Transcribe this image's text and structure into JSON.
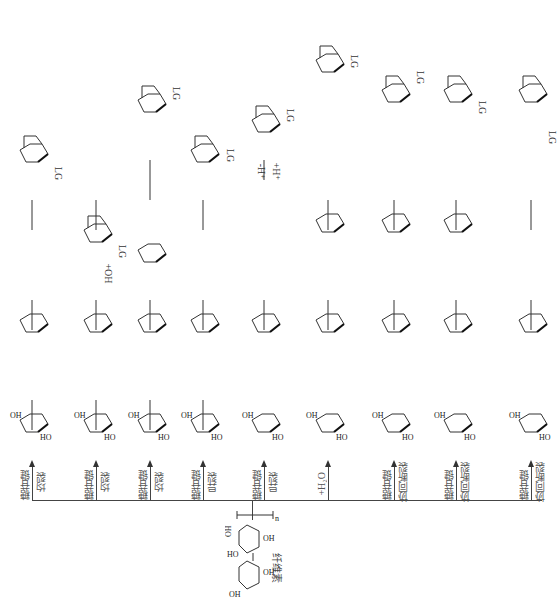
{
  "diagram": {
    "orientation": "rotated 90 degrees clockwise",
    "title": "",
    "source_node": {
      "label": "纤维素",
      "meaning": "cellulose"
    },
    "product_label": "LG",
    "branches": [
      {
        "id": "b1",
        "label_line1": "糖苷键",
        "label_line2": "均裂",
        "steps": [
          "radical intermediate",
          "dehydrated ring",
          "LG"
        ],
        "product": "LG"
      },
      {
        "id": "b2",
        "label_line1": "糖苷键",
        "label_line2": "均裂",
        "steps": [
          "O•—OH radical",
          "•OH",
          "LG"
        ],
        "step_label": "+OH",
        "product": "LG"
      },
      {
        "id": "b3",
        "label_line1": "糖苷键",
        "label_line2": "均裂",
        "steps": [
          "•O radical chain",
          "dimer",
          "LG"
        ],
        "product": "LG"
      },
      {
        "id": "b4",
        "label_line1": "糖苷键",
        "label_line2": "异裂",
        "steps": [
          "O+ cation",
          "bicyclic intermediate",
          "LG"
        ],
        "product": "LG"
      },
      {
        "id": "b5",
        "label_line1": "糖苷键",
        "label_line2": "异裂",
        "steps": [
          "cation chain",
          "oxocarbenium",
          "LG"
        ],
        "step_label_top": "-H⁺",
        "step_label_bottom": "+H⁺",
        "product": "LG"
      },
      {
        "id": "b6",
        "label_line1": "+H₂O",
        "label_line2": "",
        "steps": [
          "hydrated chain",
          "glucose",
          "LG"
        ],
        "product": "LG"
      },
      {
        "id": "b7",
        "label_line1": "糖苷键",
        "label_line2": "协同断裂",
        "steps": [
          "chain",
          "epoxide",
          "LG"
        ],
        "product": "LG"
      },
      {
        "id": "b8",
        "label_line1": "糖苷键",
        "label_line2": "协同断裂",
        "steps": [
          "chain",
          "H-bonded TS",
          "LG"
        ],
        "product": "LG"
      },
      {
        "id": "b9",
        "label_line1": "糖苷键",
        "label_line2": "协同断裂",
        "steps": [
          "chain",
          "ring-open",
          "LG"
        ],
        "product": "LG"
      }
    ],
    "atom_labels": [
      "OH",
      "HO",
      "O",
      "H",
      "•O",
      "O•",
      "+",
      "n"
    ],
    "colors": {
      "line": "#444444",
      "text": "#222222",
      "label_text": "#555555",
      "background": "#ffffff"
    }
  }
}
